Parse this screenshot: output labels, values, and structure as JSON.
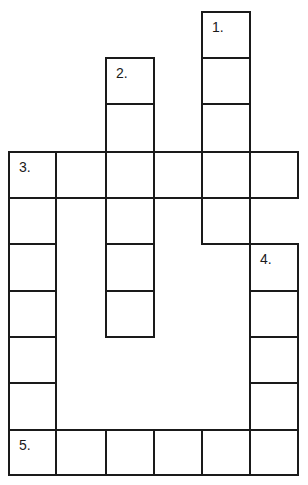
{
  "puzzle": {
    "type": "crossword",
    "clue_numbers": [
      "1.",
      "2.",
      "3.",
      "4.",
      "5."
    ],
    "colors": {
      "line": "#1a1a1a",
      "background": "#ffffff"
    },
    "words": [
      {
        "number": "1.",
        "direction": "down",
        "length": 5
      },
      {
        "number": "2.",
        "direction": "down",
        "length": 6
      },
      {
        "number": "3.",
        "direction": "across",
        "length": 6
      },
      {
        "number": "4.",
        "direction": "down",
        "length": 5
      },
      {
        "number": "5.",
        "direction": "across",
        "length": 6
      }
    ]
  }
}
